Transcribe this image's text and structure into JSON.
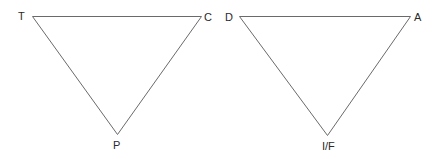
{
  "diagram": {
    "triangles": [
      {
        "name": "left-triangle",
        "vertices": [
          {
            "label": "T",
            "position": "top-left"
          },
          {
            "label": "C",
            "position": "top-right"
          },
          {
            "label": "P",
            "position": "bottom"
          }
        ]
      },
      {
        "name": "right-triangle",
        "vertices": [
          {
            "label": "D",
            "position": "top-left"
          },
          {
            "label": "A",
            "position": "top-right"
          },
          {
            "label": "I/F",
            "position": "bottom"
          }
        ]
      }
    ],
    "colors": {
      "stroke": "#6a6a6a",
      "label": "#2a2a2a",
      "background": "#ffffff"
    }
  }
}
